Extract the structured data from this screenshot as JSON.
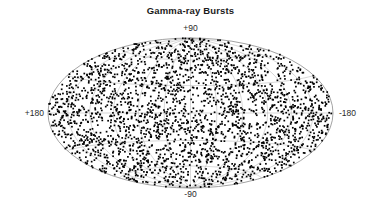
{
  "figure": {
    "title": "Gamma-ray Bursts",
    "background_color": "#ffffff"
  },
  "labels": {
    "top": "+90",
    "bottom": "-90",
    "left": "+180",
    "right": "-180"
  },
  "chart_data": {
    "type": "scatter",
    "title": "Gamma-ray Bursts",
    "projection": "aitoff-hammer-equal-area",
    "coordinate_system": "galactic",
    "xlabel": "",
    "ylabel": "",
    "xlim": [
      180,
      -180
    ],
    "ylim": [
      -90,
      90
    ],
    "x_tick_labels": [
      "+180",
      "-180"
    ],
    "y_tick_labels": [
      "+90",
      "-90"
    ],
    "grid": true,
    "grid_color": "#a9a9a9",
    "grid_meridian_step_deg": 30,
    "grid_parallel_step_deg": 30,
    "legend": null,
    "marker": {
      "shape": "square-dot",
      "color": "#000000",
      "size_px": 1.7
    },
    "point_count": 2704,
    "distribution": "isotropic-uniform-on-sphere",
    "random_seed": 20240517,
    "annotations": [],
    "series": [
      {
        "name": "Gamma-ray Bursts",
        "color": "#000000",
        "description": "Isotropic all-sky distribution of gamma-ray burst positions plotted in galactic coordinates on an equal-area Hammer-Aitoff projection."
      }
    ]
  },
  "ellipse": {
    "center_x": 190.5,
    "center_y": 113,
    "semi_major_x": 142.5,
    "semi_minor_y": 75,
    "border_color": "#8c8c8c",
    "border_width": 0.8,
    "fill_color": "#ffffff"
  }
}
